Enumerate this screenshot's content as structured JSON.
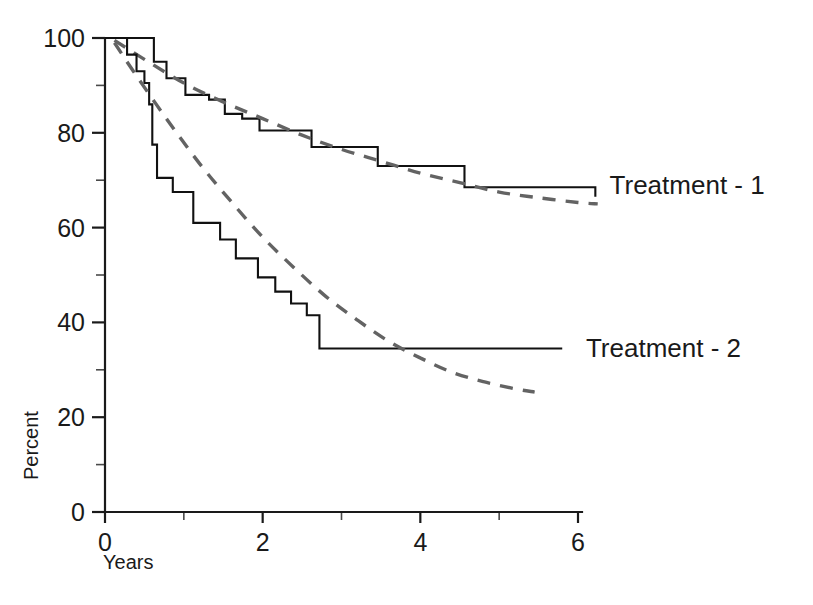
{
  "chart_data": {
    "type": "line",
    "title": "",
    "xlabel": "Years",
    "ylabel": "Percent",
    "xlim": [
      0,
      6.3
    ],
    "ylim": [
      0,
      100
    ],
    "grid": false,
    "legend_position": "right-inline",
    "x_ticks_major": [
      0,
      2,
      4,
      6
    ],
    "x_tick_labels": [
      "0",
      "2",
      "4",
      "6"
    ],
    "x_ticks_minor": [
      1,
      3,
      5
    ],
    "y_ticks_major": [
      0,
      20,
      40,
      60,
      80,
      100
    ],
    "y_tick_labels": [
      "0",
      "20",
      "40",
      "60",
      "80",
      "100"
    ],
    "y_ticks_minor": [
      10,
      30,
      50,
      70,
      90
    ],
    "series": [
      {
        "name": "Treatment - 1",
        "style": "step",
        "color": "#111111",
        "label_x": 6.35,
        "label_y": 69,
        "points": [
          [
            0.0,
            100.0
          ],
          [
            0.62,
            100.0
          ],
          [
            0.62,
            95.0
          ],
          [
            0.78,
            95.0
          ],
          [
            0.78,
            91.5
          ],
          [
            1.02,
            91.5
          ],
          [
            1.02,
            88.0
          ],
          [
            1.32,
            88.0
          ],
          [
            1.32,
            87.0
          ],
          [
            1.52,
            87.0
          ],
          [
            1.52,
            84.0
          ],
          [
            1.74,
            84.0
          ],
          [
            1.74,
            83.0
          ],
          [
            1.96,
            83.0
          ],
          [
            1.96,
            80.5
          ],
          [
            2.62,
            80.5
          ],
          [
            2.62,
            77.0
          ],
          [
            3.46,
            77.0
          ],
          [
            3.46,
            73.0
          ],
          [
            4.56,
            73.0
          ],
          [
            4.56,
            68.5
          ],
          [
            6.22,
            68.5
          ],
          [
            6.22,
            66.5
          ]
        ]
      },
      {
        "name": "Treatment - 1 fit",
        "style": "dashed-fit",
        "color": "#636363",
        "points": [
          [
            0.12,
            99.5
          ],
          [
            0.5,
            95.5
          ],
          [
            1.0,
            90.5
          ],
          [
            1.5,
            86.5
          ],
          [
            2.0,
            83.0
          ],
          [
            2.5,
            79.5
          ],
          [
            3.0,
            76.5
          ],
          [
            3.5,
            74.0
          ],
          [
            4.0,
            71.5
          ],
          [
            4.5,
            69.5
          ],
          [
            5.0,
            67.5
          ],
          [
            5.5,
            66.3
          ],
          [
            6.0,
            65.3
          ],
          [
            6.25,
            65.0
          ]
        ]
      },
      {
        "name": "Treatment - 2",
        "style": "step",
        "color": "#111111",
        "label_x": 6.05,
        "label_y": 34.5,
        "points": [
          [
            0.0,
            100.0
          ],
          [
            0.28,
            100.0
          ],
          [
            0.28,
            96.5
          ],
          [
            0.4,
            96.5
          ],
          [
            0.4,
            93.0
          ],
          [
            0.5,
            93.0
          ],
          [
            0.5,
            90.5
          ],
          [
            0.56,
            90.5
          ],
          [
            0.56,
            86.0
          ],
          [
            0.6,
            86.0
          ],
          [
            0.6,
            77.5
          ],
          [
            0.66,
            77.5
          ],
          [
            0.66,
            70.5
          ],
          [
            0.86,
            70.5
          ],
          [
            0.86,
            67.5
          ],
          [
            1.12,
            67.5
          ],
          [
            1.12,
            61.0
          ],
          [
            1.46,
            61.0
          ],
          [
            1.46,
            57.5
          ],
          [
            1.66,
            57.5
          ],
          [
            1.66,
            53.5
          ],
          [
            1.94,
            53.5
          ],
          [
            1.94,
            49.5
          ],
          [
            2.16,
            49.5
          ],
          [
            2.16,
            46.5
          ],
          [
            2.36,
            46.5
          ],
          [
            2.36,
            44.0
          ],
          [
            2.56,
            44.0
          ],
          [
            2.56,
            41.5
          ],
          [
            2.72,
            41.5
          ],
          [
            2.72,
            34.5
          ],
          [
            5.8,
            34.5
          ]
        ]
      },
      {
        "name": "Treatment - 2 fit",
        "style": "dashed-fit",
        "color": "#636363",
        "points": [
          [
            0.12,
            99.0
          ],
          [
            0.4,
            92.0
          ],
          [
            0.8,
            82.5
          ],
          [
            1.2,
            73.5
          ],
          [
            1.6,
            65.5
          ],
          [
            2.0,
            58.0
          ],
          [
            2.4,
            51.5
          ],
          [
            2.8,
            45.5
          ],
          [
            3.2,
            40.5
          ],
          [
            3.6,
            36.0
          ],
          [
            4.0,
            32.5
          ],
          [
            4.4,
            29.5
          ],
          [
            4.8,
            27.5
          ],
          [
            5.2,
            26.0
          ],
          [
            5.45,
            25.3
          ]
        ]
      }
    ]
  },
  "axes": {
    "y_title": "Percent",
    "x_title": "Years"
  },
  "legend": {
    "treatment_1": "Treatment - 1",
    "treatment_2": "Treatment - 2"
  }
}
